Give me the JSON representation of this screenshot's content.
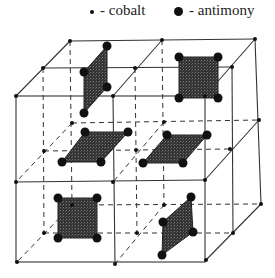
{
  "legend": {
    "cobalt": {
      "marker": "small-dot",
      "label": "- cobalt"
    },
    "antimony": {
      "marker": "large-dot",
      "label": "- antimony"
    }
  },
  "diagram": {
    "title": "",
    "colors": {
      "line": "#333333",
      "atom": "#111111",
      "ring_fill": "#3a3a3a"
    }
  }
}
